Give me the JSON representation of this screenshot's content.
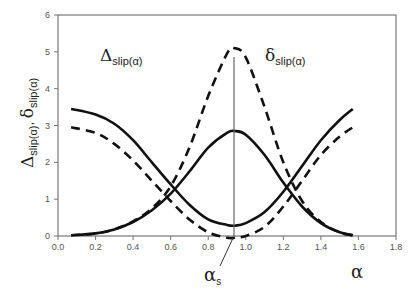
{
  "chart_data": {
    "type": "line",
    "title": "",
    "xlabel": "α",
    "ylabel": "Δslip(α), δslip(α)",
    "xlim": [
      0.0,
      1.8
    ],
    "ylim": [
      0,
      6
    ],
    "xticks": [
      "0.0",
      "0.2",
      "0.4",
      "0.6",
      "0.8",
      "1.0",
      "1.2",
      "1.4",
      "1.6",
      "1.8"
    ],
    "yticks": [
      "0",
      "1",
      "2",
      "3",
      "4",
      "5",
      "6"
    ],
    "grid": false,
    "legend": null,
    "annotations": [
      {
        "text": "Δslip(α)",
        "x": 0.33,
        "y": 5.0
      },
      {
        "text": "δslip(α)",
        "x": 1.22,
        "y": 5.0
      },
      {
        "text": "αs",
        "x": 0.9,
        "y": -1.1,
        "arrow_to": [
          0.94,
          0.0
        ]
      },
      {
        "text": "vertical line at αs",
        "x": 0.94,
        "y_from": 0,
        "y_to": 4.85
      }
    ],
    "series": [
      {
        "name": "Δslip(α) solid",
        "style": "solid",
        "x": [
          0.07,
          0.2,
          0.3,
          0.4,
          0.5,
          0.6,
          0.7,
          0.8,
          0.9,
          0.94,
          1.0,
          1.1,
          1.2,
          1.3,
          1.4,
          1.5,
          1.57
        ],
        "y": [
          3.45,
          3.3,
          3.05,
          2.6,
          2.0,
          1.4,
          0.85,
          0.45,
          0.3,
          0.28,
          0.35,
          0.65,
          1.2,
          1.9,
          2.6,
          3.15,
          3.45
        ]
      },
      {
        "name": "Δslip(α) dashed",
        "style": "dashed",
        "x": [
          0.07,
          0.2,
          0.3,
          0.4,
          0.5,
          0.6,
          0.7,
          0.8,
          0.9,
          0.94,
          1.0,
          1.1,
          1.2,
          1.3,
          1.4,
          1.5,
          1.57
        ],
        "y": [
          2.95,
          2.8,
          2.5,
          2.05,
          1.5,
          0.95,
          0.45,
          0.1,
          -0.05,
          -0.05,
          0.0,
          0.25,
          0.8,
          1.5,
          2.2,
          2.7,
          2.95
        ]
      },
      {
        "name": "δslip(α) solid",
        "style": "solid",
        "x": [
          0.07,
          0.2,
          0.3,
          0.4,
          0.5,
          0.6,
          0.7,
          0.8,
          0.9,
          0.94,
          1.0,
          1.1,
          1.2,
          1.3,
          1.4,
          1.5,
          1.57
        ],
        "y": [
          0.02,
          0.07,
          0.18,
          0.38,
          0.7,
          1.15,
          1.75,
          2.4,
          2.8,
          2.85,
          2.75,
          2.2,
          1.45,
          0.8,
          0.35,
          0.1,
          0.02
        ]
      },
      {
        "name": "δslip(α) dashed",
        "style": "dashed",
        "x": [
          0.07,
          0.2,
          0.3,
          0.4,
          0.5,
          0.6,
          0.7,
          0.8,
          0.9,
          0.94,
          1.0,
          1.1,
          1.2,
          1.3,
          1.4,
          1.5,
          1.57
        ],
        "y": [
          0.02,
          0.07,
          0.18,
          0.4,
          0.75,
          1.35,
          2.4,
          3.8,
          4.95,
          5.1,
          4.85,
          3.5,
          2.0,
          0.95,
          0.38,
          0.1,
          0.02
        ]
      }
    ]
  }
}
